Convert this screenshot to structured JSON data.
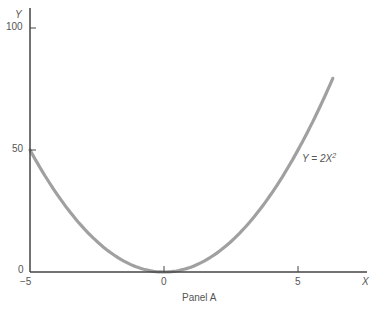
{
  "chart_data": {
    "type": "line",
    "title": "",
    "caption": "Panel A",
    "xlabel": "X",
    "ylabel": "Y",
    "xlim": [
      -5,
      6.3
    ],
    "ylim": [
      0,
      100
    ],
    "xticks": [
      -5,
      0,
      5
    ],
    "yticks": [
      0,
      50,
      100
    ],
    "grid": false,
    "series": [
      {
        "name": "Y = 2X^2",
        "equation": "Y = 2X²",
        "color": "#a0a0a0",
        "x": [
          -5,
          -4,
          -3,
          -2,
          -1,
          0,
          1,
          2,
          3,
          4,
          5,
          6,
          6.3
        ],
        "y": [
          50,
          32,
          18,
          8,
          2,
          0,
          2,
          8,
          18,
          32,
          50,
          72,
          79.4
        ]
      }
    ],
    "annotations": [
      {
        "text": "Y = 2X²",
        "x": 5.3,
        "y": 46
      }
    ]
  },
  "labels": {
    "y_axis_title": "Y",
    "x_axis_title": "X",
    "y_tick_100": "100",
    "y_tick_50": "50",
    "y_tick_0": "0",
    "x_tick_neg5": "−5",
    "x_tick_0": "0",
    "x_tick_5": "5",
    "curve_label_main": "Y = 2X",
    "curve_label_sup": "2",
    "panel_caption": "Panel A"
  }
}
